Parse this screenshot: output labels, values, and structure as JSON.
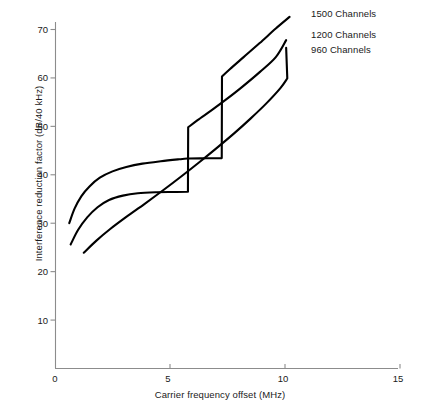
{
  "chart_data": {
    "type": "line",
    "title": "",
    "xlabel": "Carrier frequency offset (MHz)",
    "ylabel": "Interference reduction factor (dB/40 kHz)",
    "xlim": [
      0,
      16.2
    ],
    "ylim": [
      0,
      74
    ],
    "xticks": [
      0,
      5,
      10,
      15
    ],
    "xtick_labels": [
      "0",
      "5",
      "10",
      "15"
    ],
    "yticks": [
      10,
      20,
      30,
      40,
      50,
      60,
      70
    ],
    "ytick_labels": [
      "10",
      "20",
      "30",
      "40",
      "50",
      "60",
      "70"
    ],
    "grid": false,
    "legend_position": "inline-right-of-curve-ends",
    "series": [
      {
        "name": "1500 Channels",
        "label": "1500 Channels",
        "color": "#000000",
        "points": [
          [
            0.62,
            30.0
          ],
          [
            0.85,
            33.0
          ],
          [
            1.15,
            35.6
          ],
          [
            1.5,
            37.6
          ],
          [
            1.95,
            39.4
          ],
          [
            2.5,
            40.7
          ],
          [
            3.1,
            41.6
          ],
          [
            3.8,
            42.3
          ],
          [
            4.6,
            42.8
          ],
          [
            5.4,
            43.2
          ],
          [
            5.75,
            43.35
          ],
          [
            6.6,
            43.4
          ],
          [
            7.25,
            43.45
          ],
          [
            7.26,
            60.3
          ],
          [
            7.6,
            61.8
          ],
          [
            8.2,
            64.3
          ],
          [
            8.9,
            67.2
          ],
          [
            9.6,
            70.2
          ],
          [
            10.2,
            72.6
          ]
        ]
      },
      {
        "name": "1200 Channels",
        "label": "1200 Channels",
        "color": "#000000",
        "points": [
          [
            0.68,
            25.6
          ],
          [
            1.0,
            28.6
          ],
          [
            1.4,
            31.2
          ],
          [
            1.85,
            33.3
          ],
          [
            2.35,
            34.8
          ],
          [
            2.95,
            35.7
          ],
          [
            3.6,
            36.2
          ],
          [
            4.4,
            36.4
          ],
          [
            5.2,
            36.45
          ],
          [
            5.78,
            36.5
          ],
          [
            5.79,
            49.8
          ],
          [
            6.2,
            51.3
          ],
          [
            6.8,
            53.3
          ],
          [
            7.4,
            55.4
          ],
          [
            8.1,
            58.0
          ],
          [
            8.9,
            61.2
          ],
          [
            9.6,
            64.3
          ],
          [
            10.05,
            67.8
          ]
        ]
      },
      {
        "name": "960 Channels",
        "label": "960 Channels",
        "color": "#000000",
        "points": [
          [
            1.25,
            23.9
          ],
          [
            1.8,
            26.4
          ],
          [
            2.4,
            28.8
          ],
          [
            3.1,
            31.3
          ],
          [
            3.9,
            34.0
          ],
          [
            4.7,
            36.8
          ],
          [
            5.5,
            39.7
          ],
          [
            6.3,
            42.7
          ],
          [
            7.0,
            45.4
          ],
          [
            7.8,
            48.6
          ],
          [
            8.5,
            51.6
          ],
          [
            9.2,
            54.8
          ],
          [
            9.8,
            57.9
          ],
          [
            10.1,
            59.9
          ],
          [
            10.05,
            66.2
          ]
        ]
      }
    ],
    "annotations": [
      {
        "text": "1500 Channels",
        "x": 10.4,
        "y": 73.0
      },
      {
        "text": "1200 Channels",
        "x": 10.4,
        "y": 68.5
      },
      {
        "text": "960 Channels",
        "x": 10.4,
        "y": 65.3
      }
    ]
  },
  "axis": {
    "line_color": "#8c8c8c",
    "curve_color": "#000000"
  },
  "caption": {
    "text": ""
  }
}
